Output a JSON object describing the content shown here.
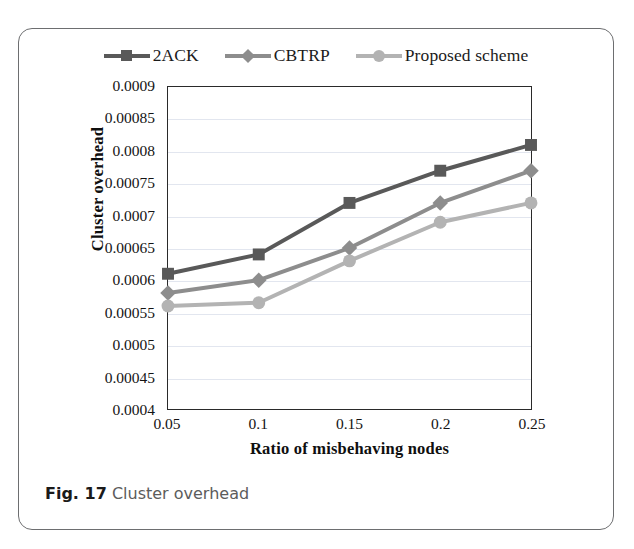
{
  "figure": {
    "caption_label": "Fig. 17",
    "caption_text": "Cluster overhead"
  },
  "colors": {
    "series_2ack": "#595959",
    "series_cbtrp": "#8d8d8d",
    "series_proposed": "#b3b3b3",
    "axis": "#2a2a2a",
    "grid": "#e2e6ef",
    "card_border": "#6d6e70"
  },
  "chart_data": {
    "type": "line",
    "title": "Cluster overhead",
    "xlabel": "Ratio  of misbehaving nodes",
    "ylabel": "Cluster overhead",
    "categories": [
      "0.05",
      "0.1",
      "0.15",
      "0.2",
      "0.25"
    ],
    "x": [
      0.05,
      0.1,
      0.15,
      0.2,
      0.25
    ],
    "xlim": [
      0.05,
      0.25
    ],
    "ylim": [
      0.0004,
      0.0009
    ],
    "ytick_labels": [
      "0.0009",
      "0.00085",
      "0.0008",
      "0.00075",
      "0.0007",
      "0.00065",
      "0.0006",
      "0.00055",
      "0.0005",
      "0.00045",
      "0.0004"
    ],
    "yticks": [
      0.0009,
      0.00085,
      0.0008,
      0.00075,
      0.0007,
      0.00065,
      0.0006,
      0.00055,
      0.0005,
      0.00045,
      0.0004
    ],
    "grid": true,
    "legend_position": "top-center",
    "series": [
      {
        "name": "2ACK",
        "marker": "square",
        "color": "#595959",
        "values": [
          0.00061,
          0.00064,
          0.00072,
          0.00077,
          0.00081
        ]
      },
      {
        "name": "CBTRP",
        "marker": "diamond",
        "color": "#8d8d8d",
        "values": [
          0.00058,
          0.0006,
          0.00065,
          0.00072,
          0.00077
        ]
      },
      {
        "name": "Proposed scheme",
        "marker": "circle",
        "color": "#b3b3b3",
        "values": [
          0.00056,
          0.000565,
          0.00063,
          0.00069,
          0.00072
        ]
      }
    ]
  }
}
